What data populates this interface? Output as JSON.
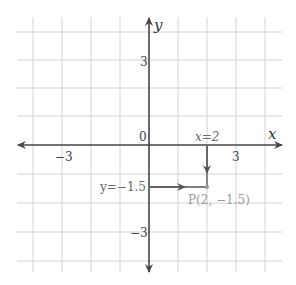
{
  "diagram": {
    "type": "coordinate-plane",
    "origin_px": [
      149,
      145
    ],
    "unit_px": 29,
    "grid_x_range": [
      -4,
      4
    ],
    "grid_y_range": [
      -4,
      4
    ],
    "colors": {
      "grid": "#cfcfcf",
      "axis": "#444444",
      "annotation": "#666666",
      "point_label": "#9a9a9a",
      "point": "#999999"
    },
    "axes": {
      "x_label": "x",
      "y_label": "y",
      "origin_label": "0"
    },
    "ticks": {
      "x_neg": "−3",
      "x_pos": "3",
      "y_pos": "3",
      "y_neg": "−3"
    },
    "annotations": {
      "vertical_guide_label": "x=2",
      "horizontal_guide_label": "y=−1.5"
    },
    "point": {
      "x": 2,
      "y": -1.5,
      "label": "P(2, −1.5)"
    }
  }
}
